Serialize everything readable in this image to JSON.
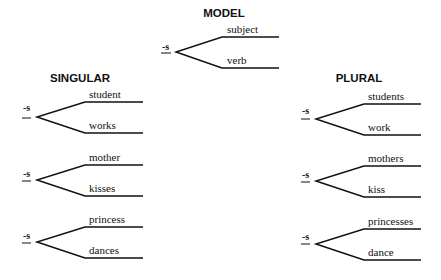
{
  "model": {
    "title": "MODEL",
    "suffix": "-s",
    "upper": "subject",
    "lower": "verb"
  },
  "singular": {
    "title": "SINGULAR",
    "items": [
      {
        "suffix": "-s",
        "upper": "student",
        "lower": "works"
      },
      {
        "suffix": "-s",
        "upper": "mother",
        "lower": "kisses"
      },
      {
        "suffix": "-s",
        "upper": "princess",
        "lower": "dances"
      }
    ]
  },
  "plural": {
    "title": "PLURAL",
    "items": [
      {
        "suffix": "-s",
        "upper": "students",
        "lower": "work"
      },
      {
        "suffix": "-s",
        "upper": "mothers",
        "lower": "kiss"
      },
      {
        "suffix": "-s",
        "upper": "princesses",
        "lower": "dance"
      }
    ]
  }
}
